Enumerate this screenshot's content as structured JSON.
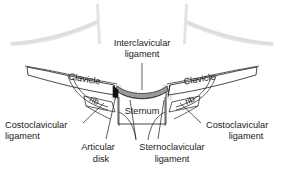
{
  "figure": {
    "type": "anatomical-diagram",
    "canvas": {
      "width": 284,
      "height": 170
    },
    "background_color": "#ffffff",
    "line_color": "#1a1a1a",
    "ghost_color": "#e3e3e3",
    "ligament_fill": "#9a9a9a"
  },
  "labels": {
    "interclavicular": {
      "line1": "Interclavicular",
      "line2": "ligament"
    },
    "clavicle_left": "Clavicle",
    "clavicle_right": "Clavicle",
    "rib_left": "rib",
    "rib_right": "rib",
    "sternum": "Sternum",
    "costoclavicular_left": {
      "line1": "Costoclavicular",
      "line2": "ligament"
    },
    "costoclavicular_right": {
      "line1": "Costoclavicular",
      "line2": "ligament"
    },
    "articular_disk": {
      "line1": "Articular",
      "line2": "disk"
    },
    "sternoclavicular": {
      "line1": "Sternoclavicular",
      "line2": "ligament"
    }
  },
  "structures": [
    {
      "name": "clavicle-left",
      "label": "Clavicle"
    },
    {
      "name": "clavicle-right",
      "label": "Clavicle"
    },
    {
      "name": "sternum",
      "label": "Sternum"
    },
    {
      "name": "rib-left",
      "label": "rib"
    },
    {
      "name": "rib-right",
      "label": "rib"
    },
    {
      "name": "interclavicular-ligament",
      "label": "Interclavicular ligament"
    },
    {
      "name": "costoclavicular-ligament-left",
      "label": "Costoclavicular ligament"
    },
    {
      "name": "costoclavicular-ligament-right",
      "label": "Costoclavicular ligament"
    },
    {
      "name": "articular-disk",
      "label": "Articular disk"
    },
    {
      "name": "sternoclavicular-ligament",
      "label": "Sternoclavicular ligament"
    }
  ]
}
